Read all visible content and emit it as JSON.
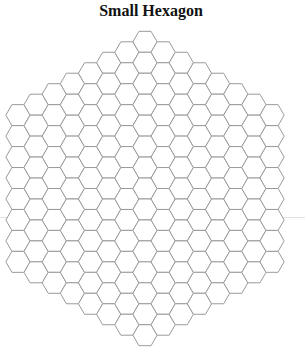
{
  "title": "Small Hexagon",
  "board": {
    "shape": "hexagon",
    "orientation": "flat-top",
    "side_length_cells": 8,
    "columns": 15,
    "center_column_cells": 15,
    "edge_column_cells": 8,
    "total_cells": 169,
    "cell_radius_px": 12.1,
    "center_x": 145,
    "center_y": 188.5,
    "stroke_color": "#9a9a9a",
    "fill_color": "#ffffff"
  },
  "rule": {
    "y": 217,
    "color": "#e2e2e2"
  }
}
